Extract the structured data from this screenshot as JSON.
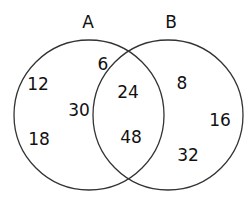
{
  "diagram": {
    "type": "venn",
    "sets": [
      {
        "id": "A",
        "label": "A"
      },
      {
        "id": "B",
        "label": "B"
      }
    ],
    "regions": {
      "a_only": [
        "12",
        "6",
        "30",
        "18"
      ],
      "a_and_b": [
        "24",
        "48"
      ],
      "b_only": [
        "8",
        "16",
        "32"
      ]
    },
    "values": {
      "v12": "12",
      "v6": "6",
      "v30": "30",
      "v18": "18",
      "v24": "24",
      "v48": "48",
      "v8": "8",
      "v16": "16",
      "v32": "32"
    },
    "stroke_color": "#333333"
  }
}
